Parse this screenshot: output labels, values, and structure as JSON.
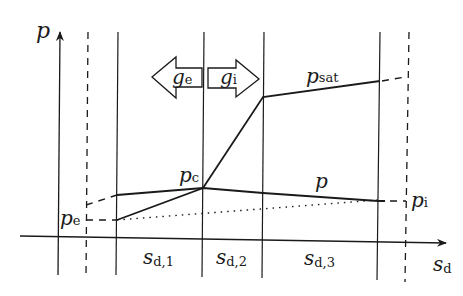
{
  "diagram": {
    "axes": {
      "y_label": "p",
      "x_label_main": "s",
      "x_label_sub": "d"
    },
    "arrows": {
      "left": {
        "main": "g",
        "sub": "e"
      },
      "right": {
        "main": "g",
        "sub": "i"
      }
    },
    "curves": {
      "p_sat": {
        "main": "p",
        "sub": "sat"
      },
      "p": {
        "main": "p"
      },
      "p_c": {
        "main": "p",
        "sub": "c"
      },
      "p_e": {
        "main": "p",
        "sub": "e"
      },
      "p_i": {
        "main": "p",
        "sub": "i"
      }
    },
    "segments": [
      {
        "main": "s",
        "sub": "d,1"
      },
      {
        "main": "s",
        "sub": "d,2"
      },
      {
        "main": "s",
        "sub": "d,3"
      }
    ]
  }
}
